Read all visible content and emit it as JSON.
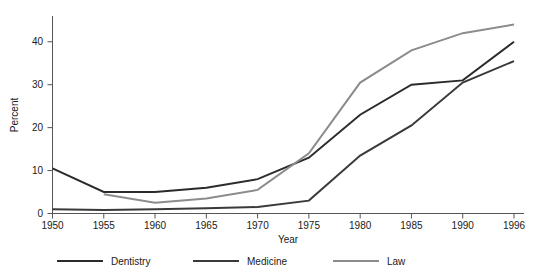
{
  "chart_data": {
    "type": "line",
    "title": "",
    "xlabel": "Year",
    "ylabel": "Percent",
    "x": [
      1950,
      1955,
      1960,
      1965,
      1970,
      1975,
      1980,
      1985,
      1990,
      1996
    ],
    "xtick_labels": [
      "1950",
      "1955",
      "1960",
      "1965",
      "1970",
      "1975",
      "1980",
      "1985",
      "1990",
      "1996"
    ],
    "ytick_labels": [
      "0",
      "10",
      "20",
      "30",
      "40"
    ],
    "yticks": [
      0,
      10,
      20,
      30,
      40
    ],
    "ylim": [
      0,
      46
    ],
    "grid": false,
    "legend_position": "bottom",
    "series": [
      {
        "name": "Dentistry",
        "color": "#2b2b2b",
        "values": [
          10.5,
          5.0,
          5.0,
          6.0,
          8.0,
          13.0,
          23.0,
          30.0,
          31.0,
          40.0
        ]
      },
      {
        "name": "Medicine",
        "color": "#3a3a3a",
        "values": [
          1.0,
          0.8,
          1.0,
          1.2,
          1.5,
          3.0,
          13.5,
          20.5,
          30.5,
          35.5
        ]
      },
      {
        "name": "Law",
        "color": "#8c8c8c",
        "values": [
          null,
          4.5,
          2.5,
          3.5,
          5.5,
          14.0,
          30.5,
          38.0,
          42.0,
          44.0
        ]
      }
    ]
  },
  "legend": {
    "items": [
      {
        "label": "Dentistry",
        "color": "#2b2b2b"
      },
      {
        "label": "Medicine",
        "color": "#3a3a3a"
      },
      {
        "label": "Law",
        "color": "#8c8c8c"
      }
    ]
  },
  "axes": {
    "y_title": "Percent",
    "x_title": "Year"
  }
}
